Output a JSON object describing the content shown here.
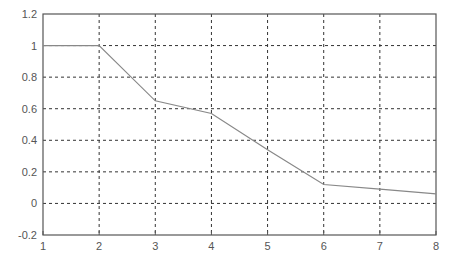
{
  "chart_data": {
    "type": "line",
    "title": "",
    "xlabel": "",
    "ylabel": "",
    "x": [
      1,
      2,
      3,
      4,
      5,
      6,
      7,
      8
    ],
    "series": [
      {
        "name": "series-1",
        "values": [
          1.0,
          1.0,
          0.65,
          0.57,
          0.34,
          0.12,
          0.09,
          0.06
        ],
        "color": "#888888"
      }
    ],
    "xlim": [
      1,
      8
    ],
    "ylim": [
      -0.2,
      1.2
    ],
    "xticks": [
      "1",
      "2",
      "3",
      "4",
      "5",
      "6",
      "7",
      "8"
    ],
    "yticks": [
      "-0.2",
      "0",
      "0.2",
      "0.4",
      "0.6",
      "0.8",
      "1",
      "1.2"
    ],
    "grid": true,
    "legend": null
  }
}
